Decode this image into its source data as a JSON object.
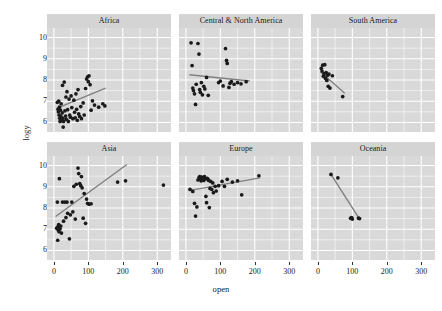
{
  "chart_data": {
    "type": "scatter",
    "title": "",
    "xlabel": "open",
    "ylabel": "logy",
    "xlim": [
      -20,
      340
    ],
    "ylim": [
      5.55,
      10.45
    ],
    "xticks": [
      0,
      100,
      200,
      300
    ],
    "xticklabels": [
      "0",
      "100",
      "200",
      "300"
    ],
    "yticks": [
      6,
      7,
      8,
      9,
      10
    ],
    "yticklabels": [
      "6",
      "7",
      "8",
      "9",
      "10"
    ],
    "grid": true,
    "legend": "none",
    "facet_layout": {
      "rows": 2,
      "cols": 3
    },
    "colors": {
      "panel_background": "#d9d9d9",
      "strip_background": "#d4d4d4",
      "gridline": "#ffffff",
      "point": "#1a1a1a",
      "trend_line": "#808080",
      "page_background": "#ffffff",
      "text": "#1a1a1a"
    },
    "panels": [
      {
        "name": "Africa",
        "row": 0,
        "col": 0,
        "trend": {
          "x0": 8,
          "y0": 6.66,
          "x1": 150,
          "y1": 7.62
        },
        "points": [
          [
            10,
            6.95
          ],
          [
            12,
            6.62
          ],
          [
            13,
            6.5
          ],
          [
            14,
            7.0
          ],
          [
            15,
            6.35
          ],
          [
            16,
            6.72
          ],
          [
            17,
            6.2
          ],
          [
            18,
            6.05
          ],
          [
            19,
            6.58
          ],
          [
            20,
            6.3
          ],
          [
            21,
            6.88
          ],
          [
            22,
            6.12
          ],
          [
            24,
            6.45
          ],
          [
            25,
            7.75
          ],
          [
            26,
            6.2
          ],
          [
            27,
            5.78
          ],
          [
            28,
            6.05
          ],
          [
            30,
            7.9
          ],
          [
            32,
            6.55
          ],
          [
            34,
            6.3
          ],
          [
            35,
            7.2
          ],
          [
            36,
            6.15
          ],
          [
            38,
            7.45
          ],
          [
            40,
            6.6
          ],
          [
            42,
            6.05
          ],
          [
            44,
            7.1
          ],
          [
            46,
            6.35
          ],
          [
            48,
            6.25
          ],
          [
            50,
            7.25
          ],
          [
            52,
            6.7
          ],
          [
            55,
            6.18
          ],
          [
            58,
            7.05
          ],
          [
            60,
            6.48
          ],
          [
            62,
            6.22
          ],
          [
            64,
            7.35
          ],
          [
            66,
            6.62
          ],
          [
            68,
            6.1
          ],
          [
            70,
            7.55
          ],
          [
            72,
            6.4
          ],
          [
            75,
            6.28
          ],
          [
            78,
            6.75
          ],
          [
            80,
            6.18
          ],
          [
            85,
            6.92
          ],
          [
            88,
            6.35
          ],
          [
            92,
            7.6
          ],
          [
            95,
            8.05
          ],
          [
            98,
            8.15
          ],
          [
            100,
            7.92
          ],
          [
            102,
            8.2
          ],
          [
            105,
            7.78
          ],
          [
            108,
            6.58
          ],
          [
            112,
            7.02
          ],
          [
            118,
            6.82
          ],
          [
            130,
            6.72
          ],
          [
            142,
            6.88
          ],
          [
            148,
            6.78
          ]
        ]
      },
      {
        "name": "Central & North America",
        "row": 0,
        "col": 1,
        "trend": {
          "x0": 10,
          "y0": 8.25,
          "x1": 185,
          "y1": 7.95
        },
        "points": [
          [
            15,
            9.75
          ],
          [
            18,
            8.68
          ],
          [
            20,
            7.62
          ],
          [
            22,
            7.5
          ],
          [
            25,
            7.35
          ],
          [
            28,
            6.85
          ],
          [
            30,
            7.8
          ],
          [
            35,
            9.72
          ],
          [
            38,
            9.22
          ],
          [
            40,
            7.55
          ],
          [
            42,
            7.42
          ],
          [
            45,
            7.88
          ],
          [
            48,
            7.3
          ],
          [
            52,
            7.7
          ],
          [
            55,
            7.58
          ],
          [
            60,
            8.12
          ],
          [
            65,
            7.28
          ],
          [
            95,
            7.88
          ],
          [
            100,
            7.95
          ],
          [
            108,
            7.72
          ],
          [
            115,
            9.48
          ],
          [
            118,
            8.92
          ],
          [
            120,
            8.78
          ],
          [
            125,
            7.65
          ],
          [
            128,
            7.85
          ],
          [
            132,
            7.92
          ],
          [
            140,
            7.8
          ],
          [
            150,
            7.88
          ],
          [
            160,
            7.82
          ],
          [
            175,
            7.92
          ]
        ]
      },
      {
        "name": "South America",
        "row": 0,
        "col": 2,
        "trend": {
          "x0": 8,
          "y0": 8.38,
          "x1": 78,
          "y1": 7.38
        },
        "points": [
          [
            10,
            8.55
          ],
          [
            12,
            8.42
          ],
          [
            14,
            8.7
          ],
          [
            16,
            8.18
          ],
          [
            18,
            8.3
          ],
          [
            20,
            8.72
          ],
          [
            22,
            8.08
          ],
          [
            24,
            8.35
          ],
          [
            26,
            7.98
          ],
          [
            28,
            8.22
          ],
          [
            30,
            7.7
          ],
          [
            32,
            8.28
          ],
          [
            35,
            7.62
          ],
          [
            42,
            8.2
          ],
          [
            72,
            7.22
          ]
        ]
      },
      {
        "name": "Asia",
        "row": 1,
        "col": 0,
        "trend": {
          "x0": 5,
          "y0": 7.6,
          "x1": 212,
          "y1": 10.05
        },
        "points": [
          [
            8,
            7.05
          ],
          [
            10,
            8.28
          ],
          [
            11,
            6.48
          ],
          [
            12,
            7.12
          ],
          [
            13,
            6.95
          ],
          [
            14,
            7.22
          ],
          [
            15,
            6.88
          ],
          [
            16,
            9.38
          ],
          [
            18,
            7.02
          ],
          [
            20,
            7.15
          ],
          [
            22,
            6.82
          ],
          [
            25,
            8.28
          ],
          [
            28,
            7.38
          ],
          [
            32,
            8.28
          ],
          [
            35,
            7.55
          ],
          [
            38,
            8.28
          ],
          [
            40,
            7.75
          ],
          [
            45,
            6.55
          ],
          [
            48,
            7.68
          ],
          [
            52,
            8.28
          ],
          [
            55,
            7.82
          ],
          [
            58,
            9.02
          ],
          [
            62,
            7.48
          ],
          [
            65,
            9.12
          ],
          [
            70,
            9.88
          ],
          [
            72,
            9.62
          ],
          [
            75,
            9.15
          ],
          [
            78,
            9.05
          ],
          [
            80,
            9.48
          ],
          [
            82,
            8.95
          ],
          [
            85,
            7.52
          ],
          [
            88,
            8.68
          ],
          [
            92,
            7.28
          ],
          [
            95,
            8.42
          ],
          [
            98,
            8.22
          ],
          [
            102,
            8.18
          ],
          [
            108,
            8.2
          ],
          [
            185,
            9.22
          ],
          [
            208,
            9.28
          ],
          [
            318,
            9.08
          ]
        ]
      },
      {
        "name": "Europe",
        "row": 1,
        "col": 1,
        "trend": {
          "x0": 8,
          "y0": 8.82,
          "x1": 215,
          "y1": 9.42
        },
        "points": [
          [
            12,
            8.88
          ],
          [
            20,
            8.78
          ],
          [
            25,
            8.22
          ],
          [
            28,
            7.62
          ],
          [
            32,
            8.05
          ],
          [
            35,
            9.32
          ],
          [
            38,
            9.42
          ],
          [
            40,
            9.48
          ],
          [
            42,
            9.38
          ],
          [
            44,
            9.28
          ],
          [
            46,
            9.45
          ],
          [
            48,
            9.35
          ],
          [
            50,
            9.42
          ],
          [
            52,
            9.3
          ],
          [
            54,
            9.48
          ],
          [
            56,
            9.38
          ],
          [
            58,
            8.55
          ],
          [
            60,
            8.25
          ],
          [
            62,
            9.4
          ],
          [
            64,
            9.35
          ],
          [
            66,
            9.3
          ],
          [
            68,
            8.02
          ],
          [
            70,
            8.92
          ],
          [
            72,
            9.25
          ],
          [
            75,
            8.88
          ],
          [
            78,
            9.18
          ],
          [
            80,
            8.72
          ],
          [
            85,
            9.02
          ],
          [
            88,
            8.8
          ],
          [
            95,
            9.05
          ],
          [
            105,
            9.25
          ],
          [
            112,
            9.02
          ],
          [
            120,
            9.35
          ],
          [
            135,
            9.22
          ],
          [
            150,
            9.28
          ],
          [
            162,
            8.62
          ],
          [
            212,
            9.52
          ]
        ]
      },
      {
        "name": "Oceania",
        "row": 1,
        "col": 2,
        "trend": {
          "x0": 38,
          "y0": 9.58,
          "x1": 122,
          "y1": 7.45
        },
        "points": [
          [
            38,
            9.58
          ],
          [
            58,
            9.42
          ],
          [
            95,
            7.52
          ],
          [
            98,
            7.55
          ],
          [
            100,
            7.48
          ],
          [
            118,
            7.52
          ],
          [
            121,
            7.5
          ]
        ]
      }
    ]
  }
}
